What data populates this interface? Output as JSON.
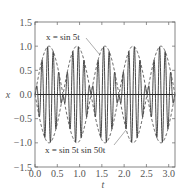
{
  "chart_data": {
    "type": "line",
    "title": "",
    "xlabel": "t",
    "ylabel": "x",
    "xlim": [
      0,
      3.1416
    ],
    "ylim": [
      -1.5,
      1.5
    ],
    "xticks": [
      "0.0",
      "0.5",
      "1.0",
      "1.5",
      "2.0",
      "2.5",
      "3.0"
    ],
    "yticks": [
      "1.5",
      "1.0",
      "0.5",
      "0.0",
      "-0.5",
      "-1.0",
      "-1.5"
    ],
    "grid": false,
    "series": [
      {
        "name": "x = sin 5t",
        "style": "dashed",
        "function": "sin(5t)",
        "x": [
          0,
          0.314,
          0.628,
          0.942,
          1.257,
          1.571,
          1.885,
          2.199,
          2.513,
          2.827,
          3.142
        ],
        "values": [
          0,
          1,
          0,
          -1,
          0,
          1,
          0,
          -1,
          0,
          1,
          0
        ]
      },
      {
        "name": "x = sin 5t sin 50t",
        "style": "solid",
        "function": "sin(5t)*sin(50t)"
      },
      {
        "name": "x = -sin 5t (envelope)",
        "style": "dashed",
        "function": "-sin(5t)"
      }
    ],
    "annotations": [
      {
        "text": "x = sin 5t",
        "points_to": "dashed envelope near t=1.5"
      },
      {
        "text": "x = sin 5t sin 50t",
        "points_to": "solid curve near t=1.9"
      }
    ]
  },
  "labels": {
    "xlabel": "t",
    "ylabel": "x",
    "annot_top": "x = sin 5t",
    "annot_bottom": "x = sin 5t sin 50t"
  }
}
